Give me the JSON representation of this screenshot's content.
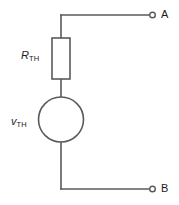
{
  "diagram": {
    "stroke_color": "#5a5a5a",
    "text_color": "#1c1c1c",
    "background": "#ffffff",
    "components": {
      "resistor": {
        "name": "resistor-rth",
        "symbol": "R",
        "subscript": "TH",
        "shape": "rectangle"
      },
      "source": {
        "name": "voltage-source-vth",
        "symbol": "v",
        "subscript": "TH",
        "shape": "circle"
      }
    },
    "terminals": [
      {
        "id": "a",
        "label": "A",
        "marker": "open-circle"
      },
      {
        "id": "b",
        "label": "B",
        "marker": "open-circle"
      }
    ]
  }
}
